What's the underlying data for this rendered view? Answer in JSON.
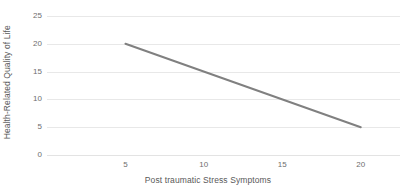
{
  "chart_data": {
    "type": "line",
    "title": "",
    "xlabel": "Post traumatic Stress Symptoms",
    "ylabel": "Health-Related Quality of Life",
    "xlim": [
      0,
      22.5
    ],
    "ylim": [
      0,
      25
    ],
    "xticks": [
      5,
      10,
      15,
      20
    ],
    "xtick_labels": [
      "5",
      "10",
      "15",
      "20"
    ],
    "yticks": [
      0,
      5,
      10,
      15,
      20,
      25
    ],
    "ytick_labels": [
      "0",
      "5",
      "10",
      "15",
      "20",
      "25"
    ],
    "grid": "horizontal",
    "legend": "none",
    "series": [
      {
        "name": "regression-line",
        "color": "#808080",
        "x": [
          5,
          20
        ],
        "values": [
          20,
          5
        ]
      }
    ]
  }
}
